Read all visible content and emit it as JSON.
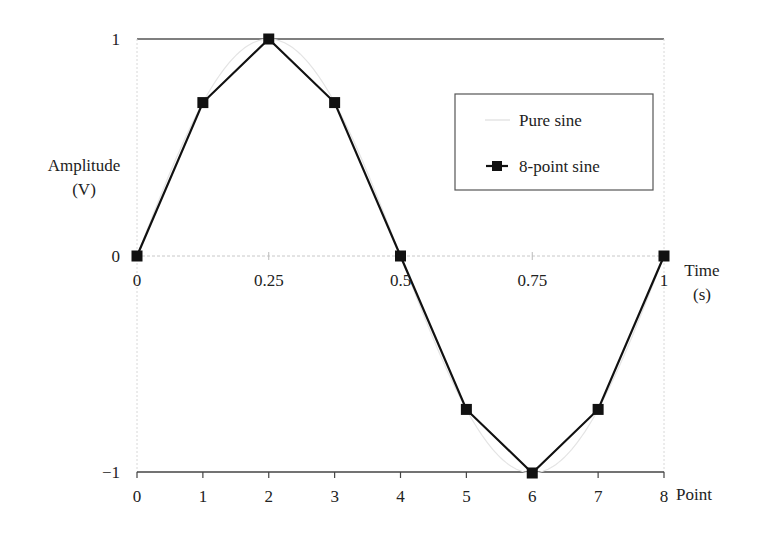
{
  "chart_data": {
    "type": "line",
    "title": "",
    "ylabel": "Amplitude (V)",
    "ylabel_lines": [
      "Amplitude",
      "(V)"
    ],
    "xlabel_top": "Time (s)",
    "xlabel_top_lines": [
      "Time",
      "(s)"
    ],
    "xlabel_bottom": "Point",
    "ylim": [
      -1,
      1
    ],
    "xlim": [
      0,
      1
    ],
    "yticks": [
      "1",
      "0",
      "−1"
    ],
    "xticks_time": [
      "0",
      "0.25",
      "0.5",
      "0.75",
      "1"
    ],
    "xticks_point": [
      "0",
      "1",
      "2",
      "3",
      "4",
      "5",
      "6",
      "7",
      "8"
    ],
    "grid": true,
    "legend_position": "upper right",
    "series": [
      {
        "name": "Pure sine",
        "style": "light gray continuous curve",
        "color": "#e4e4e4",
        "function": "sin(2*pi*t)"
      },
      {
        "name": "8-point sine",
        "style": "black line with square markers",
        "color": "#111111",
        "x_point": [
          0,
          1,
          2,
          3,
          4,
          5,
          6,
          7,
          8
        ],
        "x_time": [
          0,
          0.125,
          0.25,
          0.375,
          0.5,
          0.625,
          0.75,
          0.875,
          1
        ],
        "values": [
          0,
          0.707,
          1,
          0.707,
          0,
          -0.707,
          -1,
          -0.707,
          0
        ]
      }
    ]
  },
  "legend": {
    "items": [
      {
        "label": "Pure sine"
      },
      {
        "label": "8-point sine"
      }
    ]
  }
}
